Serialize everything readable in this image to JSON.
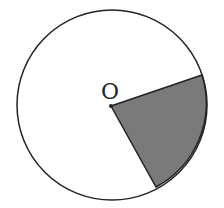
{
  "diagram": {
    "center_label": "O",
    "circle": {
      "cx": 112,
      "cy": 105,
      "r": 95
    },
    "sector": {
      "start": [
        202,
        75
      ],
      "end": [
        156,
        187
      ],
      "fill": "#7a7a7a"
    },
    "stroke": "#222222"
  }
}
